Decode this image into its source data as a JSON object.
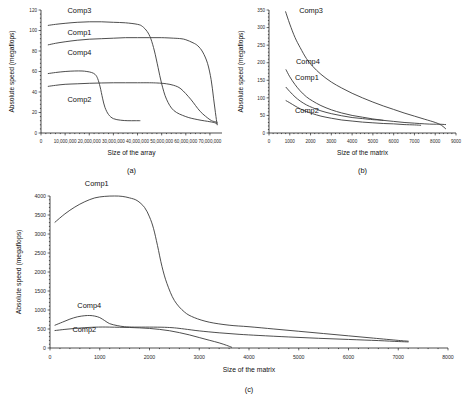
{
  "figure": {
    "panels": [
      "a",
      "b",
      "c"
    ],
    "caption_a": "(a)",
    "caption_b": "(b)",
    "caption_c": "(c)"
  },
  "chart_data": [
    {
      "id": "a",
      "type": "line",
      "title": "",
      "caption": "(a)",
      "xlabel": "Size of the array",
      "ylabel": "Absolute speed (megaflops)",
      "xlim": [
        0,
        75000000
      ],
      "ylim": [
        0,
        120
      ],
      "xticks": [
        0,
        10000000,
        20000000,
        30000000,
        40000000,
        50000000,
        60000000,
        70000000
      ],
      "xticklabels": [
        "0",
        "10,000,000",
        "20,000,000",
        "30,000,000",
        "40,000,000",
        "50,000,000",
        "60,000,000",
        "70,000,000"
      ],
      "yticks": [
        0,
        20,
        40,
        60,
        80,
        100,
        120
      ],
      "yticklabels": [
        "0",
        "20",
        "40",
        "60",
        "80",
        "100",
        "120"
      ],
      "grid": false,
      "legend_position": "inline-annotations",
      "series": [
        {
          "name": "Comp3",
          "label_x": 11000000,
          "label_y": 117,
          "x": [
            3000000,
            6000000,
            10000000,
            15000000,
            20000000,
            25000000,
            30000000,
            35000000,
            40000000,
            42000000,
            44000000,
            45500000,
            47000000,
            48500000,
            50000000,
            52000000,
            55000000,
            60000000,
            65000000,
            70000000,
            72000000,
            73000000
          ],
          "y": [
            105,
            106,
            107,
            108,
            108.5,
            108.5,
            108,
            107.5,
            106,
            104,
            99,
            92,
            80,
            64,
            48,
            33,
            22,
            16,
            13,
            11,
            10,
            9
          ]
        },
        {
          "name": "Comp1",
          "label_x": 11000000,
          "label_y": 96,
          "x": [
            3000000,
            6000000,
            10000000,
            15000000,
            20000000,
            25000000,
            30000000,
            35000000,
            40000000,
            45000000,
            50000000,
            55000000,
            58000000,
            60000000,
            63000000,
            65000000,
            67000000,
            69000000,
            70500000,
            71500000,
            72500000,
            73000000
          ],
          "y": [
            86,
            87.5,
            89,
            90.5,
            91.5,
            92,
            92.5,
            93,
            93,
            93,
            93,
            92.5,
            92,
            91,
            88,
            85,
            79,
            68,
            52,
            34,
            16,
            8
          ]
        },
        {
          "name": "Comp4",
          "label_x": 11000000,
          "label_y": 76,
          "x": [
            3000000,
            6000000,
            10000000,
            15000000,
            20000000,
            25000000,
            30000000,
            35000000,
            40000000,
            45000000,
            48000000,
            50000000,
            52000000,
            55000000,
            58000000,
            62000000,
            66000000,
            70000000,
            72000000,
            73000000
          ],
          "y": [
            45.5,
            46.5,
            47.5,
            48,
            48.5,
            48.8,
            49,
            49,
            49,
            49,
            48.8,
            48.5,
            48,
            46.5,
            43,
            33,
            21,
            13,
            11,
            10.5
          ]
        },
        {
          "name": "Comp2",
          "label_x": 11000000,
          "label_y": 30,
          "x": [
            3000000,
            6000000,
            10000000,
            14000000,
            17000000,
            19000000,
            21000000,
            22500000,
            23500000,
            24500000,
            25500000,
            26500000,
            28000000,
            30000000,
            33000000,
            36000000,
            39000000,
            41000000
          ],
          "y": [
            58,
            59,
            60,
            60.5,
            60.5,
            60,
            59,
            57,
            53,
            45,
            34,
            25,
            18,
            14,
            12.5,
            12,
            12,
            12
          ]
        }
      ]
    },
    {
      "id": "b",
      "type": "line",
      "title": "",
      "caption": "(b)",
      "xlabel": "Size of the matrix",
      "ylabel": "Absolute speed (megaflops)",
      "xlim": [
        0,
        9000
      ],
      "ylim": [
        0,
        350
      ],
      "xticks": [
        0,
        1000,
        2000,
        3000,
        4000,
        5000,
        6000,
        7000,
        8000,
        9000
      ],
      "xticklabels": [
        "0",
        "1000",
        "2000",
        "3000",
        "4000",
        "5000",
        "6000",
        "7000",
        "8000",
        "9000"
      ],
      "yticks": [
        0,
        50,
        100,
        150,
        200,
        250,
        300,
        350
      ],
      "yticklabels": [
        "0",
        "50",
        "100",
        "150",
        "200",
        "250",
        "300",
        "350"
      ],
      "grid": false,
      "legend_position": "inline-annotations",
      "series": [
        {
          "name": "Comp3",
          "label_x": 1450,
          "label_y": 342,
          "x": [
            800,
            1000,
            1250,
            1500,
            1800,
            2100,
            2500,
            3000,
            3500,
            4000,
            4500,
            5000,
            5500,
            6000,
            6500,
            7000,
            7500,
            8000,
            8300,
            8500
          ],
          "y": [
            345,
            310,
            272,
            243,
            212,
            190,
            167,
            145,
            128,
            113,
            100,
            88,
            77,
            67,
            57,
            48,
            39,
            30,
            22,
            12
          ]
        },
        {
          "name": "Comp4",
          "label_x": 1300,
          "label_y": 196,
          "x": [
            820,
            1000,
            1250,
            1500,
            1800,
            2100,
            2500,
            3000,
            3500,
            4000,
            4500,
            5000,
            5500,
            6000,
            6500,
            7000,
            7500,
            7900,
            8200,
            8500
          ],
          "y": [
            180,
            160,
            138,
            120,
            103,
            91,
            78,
            66,
            57,
            50,
            45,
            40,
            36,
            33,
            30,
            28,
            26,
            25,
            25,
            24
          ]
        },
        {
          "name": "Comp1",
          "label_x": 1250,
          "label_y": 152,
          "x": [
            820,
            1000,
            1250,
            1500,
            1800,
            2100,
            2500,
            3000,
            3500,
            4000,
            4500,
            5000,
            5300,
            5500
          ],
          "y": [
            130,
            118,
            103,
            91,
            80,
            72,
            63,
            55,
            49,
            44,
            41,
            38,
            37,
            36
          ]
        },
        {
          "name": "Comp2",
          "label_x": 1250,
          "label_y": 58,
          "x": [
            820,
            1000,
            1250,
            1500,
            1800,
            2100,
            2500,
            3000,
            3500,
            4000,
            4500,
            5000,
            5500,
            6000,
            6500,
            7000,
            7300
          ],
          "y": [
            92,
            86,
            77,
            69,
            61,
            55,
            48,
            42,
            37,
            34,
            31,
            29,
            27,
            26,
            24,
            23,
            22
          ]
        }
      ]
    },
    {
      "id": "c",
      "type": "line",
      "title": "",
      "caption": "(c)",
      "xlabel": "Size of the matrix",
      "ylabel": "Absolute speed (megaflops)",
      "xlim": [
        0,
        8000
      ],
      "ylim": [
        0,
        4000
      ],
      "xticks": [
        0,
        1000,
        2000,
        3000,
        4000,
        5000,
        6000,
        7000,
        8000
      ],
      "xticklabels": [
        "0",
        "1000",
        "2000",
        "3000",
        "4000",
        "5000",
        "6000",
        "7000",
        "8000"
      ],
      "yticks": [
        0,
        500,
        1000,
        1500,
        2000,
        2500,
        3000,
        3500,
        4000
      ],
      "yticklabels": [
        "0",
        "500",
        "1000",
        "1500",
        "2000",
        "2500",
        "3000",
        "3500",
        "4000"
      ],
      "grid": false,
      "legend_position": "inline-annotations",
      "series": [
        {
          "name": "Comp1",
          "label_x": 700,
          "label_y": 4260,
          "x": [
            100,
            300,
            500,
            700,
            900,
            1100,
            1300,
            1450,
            1600,
            1750,
            1900,
            2000,
            2080,
            2160,
            2250,
            2350,
            2500,
            2700,
            2900,
            3200,
            3600,
            4000,
            4500,
            5000,
            5500,
            6000,
            6500,
            7000,
            7200
          ],
          "y": [
            3310,
            3530,
            3710,
            3850,
            3950,
            3990,
            4000,
            3990,
            3950,
            3880,
            3700,
            3450,
            3150,
            2700,
            2150,
            1700,
            1250,
            950,
            800,
            680,
            600,
            560,
            500,
            440,
            380,
            320,
            260,
            200,
            180
          ]
        },
        {
          "name": "Comp4",
          "label_x": 550,
          "label_y": 1060,
          "x": [
            100,
            250,
            400,
            550,
            700,
            800,
            900,
            1000,
            1100,
            1200,
            1350,
            1500,
            1700,
            2000,
            2300,
            2500,
            2700,
            3000,
            3400,
            3800,
            4200,
            4800,
            5400,
            6000,
            6600,
            7000,
            7200
          ],
          "y": [
            600,
            680,
            760,
            820,
            850,
            855,
            840,
            800,
            720,
            640,
            590,
            560,
            550,
            550,
            545,
            530,
            500,
            450,
            400,
            360,
            330,
            290,
            255,
            225,
            195,
            170,
            160
          ]
        },
        {
          "name": "Comp2",
          "label_x": 450,
          "label_y": 430,
          "x": [
            100,
            300,
            500,
            700,
            900,
            1050,
            1200,
            1400,
            1600,
            1800,
            2000,
            2200,
            2400,
            2600,
            2800,
            3000,
            3200,
            3400,
            3550,
            3650
          ],
          "y": [
            460,
            490,
            515,
            535,
            548,
            552,
            550,
            545,
            540,
            530,
            515,
            490,
            455,
            405,
            345,
            275,
            205,
            135,
            70,
            20
          ]
        }
      ]
    }
  ]
}
